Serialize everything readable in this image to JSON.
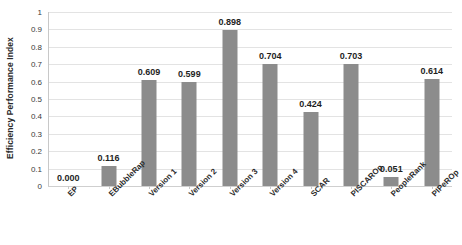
{
  "chart_data": {
    "type": "bar",
    "title": "",
    "xlabel": "",
    "ylabel": "Efficiency Performance Index",
    "ylim": [
      0,
      1
    ],
    "grid": true,
    "legend": "none",
    "bar_color": "#8c8c8c",
    "gridline_color": "#e3e3e3",
    "categories": [
      "EP",
      "EBubbleRap",
      "Version 1",
      "Version 2",
      "Version 3",
      "Version 4",
      "SCAR",
      "PISCAROp",
      "PeopleRank",
      "PIPeROp"
    ],
    "values": [
      0.0,
      0.116,
      0.609,
      0.599,
      0.898,
      0.704,
      0.424,
      0.703,
      0.051,
      0.614
    ],
    "data_labels": [
      "0.000",
      "0.116",
      "0.609",
      "0.599",
      "0.898",
      "0.704",
      "0.424",
      "0.703",
      "0.051",
      "0.614"
    ],
    "yticks": [
      1,
      0.9,
      0.8,
      0.7,
      0.6,
      0.5,
      0.4,
      0.3,
      0.2,
      0.1,
      0
    ],
    "ytick_labels": [
      "1",
      "0.9",
      "0.8",
      "0.7",
      "0.6",
      "0.5",
      "0.4",
      "0.3",
      "0.2",
      "0.1",
      "0"
    ]
  }
}
